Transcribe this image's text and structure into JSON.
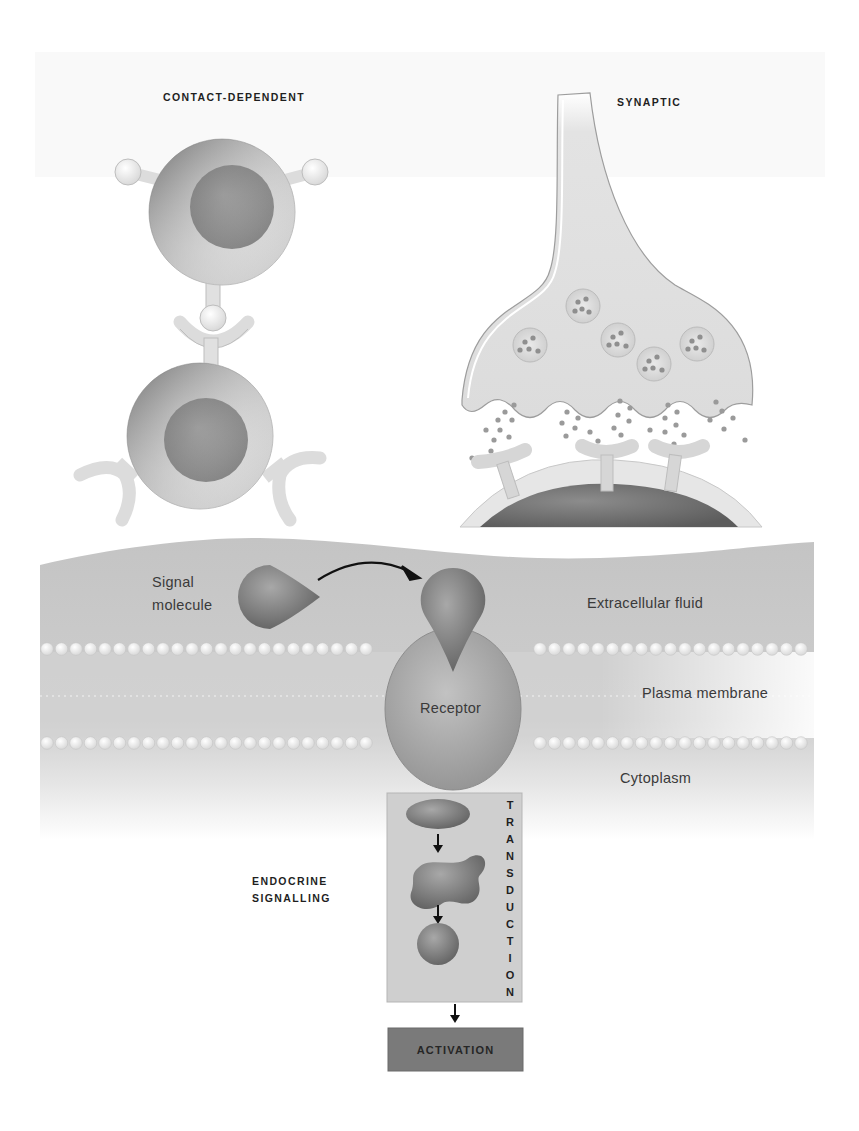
{
  "figure": {
    "panels": {
      "contact_dependent": {
        "title": "CONTACT-DEPENDENT"
      },
      "synaptic": {
        "title": "SYNAPTIC"
      },
      "endocrine": {
        "title_line1": "ENDOCRINE",
        "title_line2": "SIGNALLING"
      }
    },
    "membrane_labels": {
      "signal_line1": "Signal",
      "signal_line2": "molecule",
      "extracellular": "Extracellular fluid",
      "plasma_membrane": "Plasma membrane",
      "cytoplasm": "Cytoplasm",
      "receptor": "Receptor"
    },
    "transduction": {
      "label": "TRANSDUCTION",
      "letters": [
        "T",
        "R",
        "A",
        "N",
        "S",
        "D",
        "U",
        "C",
        "T",
        "I",
        "O",
        "N"
      ]
    },
    "activation": {
      "label": "ACTIVATION"
    },
    "colors": {
      "background": "#ffffff",
      "band": "#c9c9c9",
      "band_dark": "#b4b4b4",
      "molecule": "#7d7d7d",
      "receptor": "#a9a9a9",
      "cell_light": "#e4e4e4",
      "nucleus": "#8e8e8e",
      "transduction_box": "#cfcfcf",
      "activation_box": "#7a7a7a",
      "text": "#2b2b2b"
    }
  }
}
